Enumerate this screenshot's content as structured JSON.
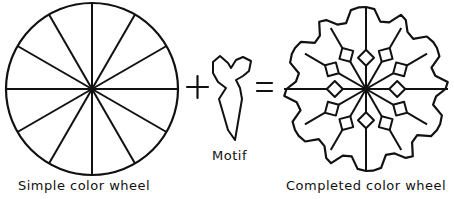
{
  "labels": {
    "simple": "Simple color wheel",
    "motif": "Motif",
    "completed": "Completed color wheel"
  },
  "operators": {
    "plus": "+",
    "equals": "="
  },
  "style": {
    "stroke": "#111111",
    "background": "#ffffff"
  },
  "simple_wheel": {
    "cx": 92,
    "cy": 89,
    "r": 86,
    "segments": 12
  },
  "completed_wheel": {
    "cx": 366,
    "cy": 89,
    "r": 82,
    "segments": 12,
    "diamonds": 12
  }
}
